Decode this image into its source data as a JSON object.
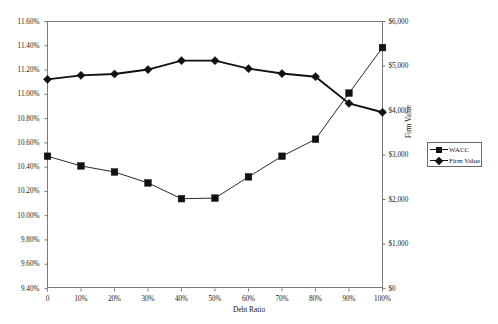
{
  "chart_data": {
    "type": "line",
    "title": "",
    "xlabel": "Debt Ratio",
    "ylabel": "",
    "y2label": "Firm Value",
    "grid": false,
    "legend_position": "right",
    "categories": [
      "0",
      "10%",
      "20%",
      "30%",
      "40%",
      "50%",
      "60%",
      "70%",
      "80%",
      "90%",
      "100%"
    ],
    "x_tick_labels": [
      "0",
      "10%",
      "20%",
      "30%",
      "40%",
      "50%",
      "60%",
      "70%",
      "80%",
      "90%",
      "100%"
    ],
    "y_tick_labels": [
      "11.60%",
      "11.40%",
      "11.20%",
      "11.00%",
      "10.80%",
      "10.60%",
      "10.40%",
      "10.20%",
      "10.00%",
      "9.80%",
      "9.60%",
      "9.40%"
    ],
    "y2_tick_labels": [
      "$6,000",
      "$5,000",
      "$4,000",
      "$3,000",
      "$2,000",
      "$1,000",
      "$0"
    ],
    "ylim": [
      9.4,
      11.6
    ],
    "y2lim": [
      0,
      6000
    ],
    "series": [
      {
        "name": "WACC",
        "axis": "left",
        "marker": "square",
        "color": "#111111",
        "values": [
          10.49,
          10.41,
          10.36,
          10.27,
          10.14,
          10.145,
          10.32,
          10.49,
          10.63,
          11.01,
          11.385
        ]
      },
      {
        "name": "Firm Value",
        "axis": "right",
        "marker": "diamond",
        "color": "#111111",
        "values": [
          4700,
          4790,
          4820,
          4920,
          5120,
          5120,
          4940,
          4830,
          4760,
          4160,
          3960
        ]
      }
    ]
  },
  "legend": {
    "items": [
      {
        "label": "WACC",
        "marker": "square"
      },
      {
        "label": "Firm Value",
        "marker": "diamond"
      }
    ]
  }
}
